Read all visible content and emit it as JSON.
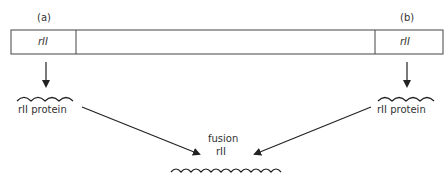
{
  "diagram": {
    "labels": {
      "a": "(a)",
      "b": "(b)"
    },
    "gene_bar": {
      "left_segment": "rII",
      "right_segment": "rII"
    },
    "left_product": "rII protein",
    "right_product": "rII protein",
    "fusion": {
      "line1": "fusion",
      "line2": "rII"
    },
    "colors": {
      "line": "#222222",
      "background": "#ffffff"
    }
  }
}
